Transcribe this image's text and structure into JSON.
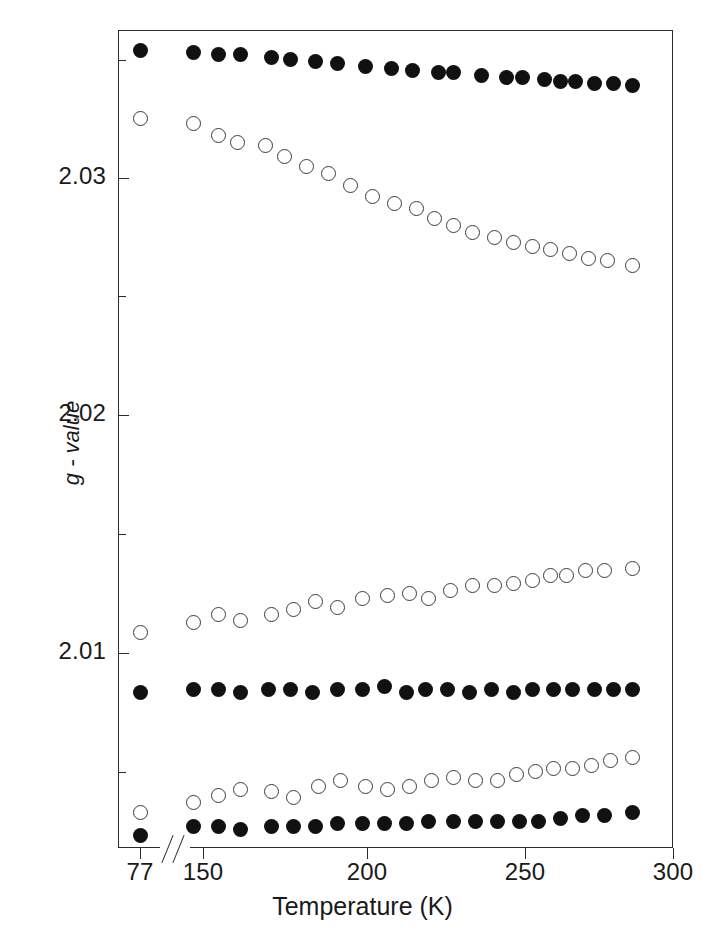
{
  "figure": {
    "width": 725,
    "height": 932,
    "background": "#ffffff",
    "marker_colors": {
      "filled": "#111111",
      "open_edge": "#3a3a3a",
      "open_face": "#ffffff"
    },
    "axis_color": "#2b2b2b"
  },
  "axis_titles": {
    "x": "Temperature (K)",
    "y": "g - value"
  },
  "x_axis": {
    "tick_labels": [
      "77",
      "150",
      "200",
      "250",
      "300"
    ],
    "tick_values": [
      77,
      150,
      200,
      250,
      300
    ],
    "tick_pixels": [
      140,
      203,
      367,
      525,
      673
    ],
    "broken_axis": true,
    "break_between": [
      77,
      150
    ],
    "break_symbol": "//"
  },
  "y_axis": {
    "tick_labels": [
      "2.03",
      "2.02",
      "2.01"
    ],
    "tick_values": [
      2.03,
      2.02,
      2.01
    ],
    "tick_pixels": [
      178,
      415,
      653
    ],
    "minor_tick_pixels": [
      60,
      296,
      534,
      772
    ],
    "minor_tick_values": [
      2.035,
      2.025,
      2.015,
      2.005
    ],
    "range": [
      2.0025,
      2.0375
    ]
  },
  "chart_data": {
    "type": "scatter",
    "title": "",
    "xlabel": "Temperature (K)",
    "ylabel": "g - value",
    "xlim": [
      70,
      300
    ],
    "ylim": [
      2.0025,
      2.0375
    ],
    "grid": false,
    "legend": "none",
    "broken_x_axis": {
      "from": 80,
      "to": 145
    },
    "series": [
      {
        "name": "upper-filled",
        "marker": "filled-circle",
        "x": [
          77,
          147,
          155,
          162,
          172,
          178,
          186,
          193,
          202,
          210,
          217,
          225,
          230,
          239,
          247,
          252,
          259,
          264,
          269,
          275,
          281,
          287
        ],
        "y": [
          2.0352,
          2.0351,
          2.035,
          2.035,
          2.0349,
          2.0348,
          2.0347,
          2.0346,
          2.0345,
          2.0344,
          2.0343,
          2.0342,
          2.0342,
          2.0341,
          2.034,
          2.034,
          2.0339,
          2.0338,
          2.0338,
          2.0337,
          2.0337,
          2.0336
        ],
        "y_pixels": [
          50,
          52,
          54,
          54,
          57,
          59,
          61,
          63,
          66,
          68,
          70,
          72,
          72,
          75,
          77,
          77,
          79,
          81,
          81,
          83,
          83,
          85
        ]
      },
      {
        "name": "upper-open",
        "marker": "open-circle",
        "x": [
          77,
          147,
          155,
          161,
          170,
          176,
          183,
          190,
          197,
          204,
          211,
          218,
          224,
          230,
          236,
          243,
          249,
          255,
          261,
          267,
          273,
          279,
          287
        ],
        "y": [
          2.0325,
          2.0323,
          2.0318,
          2.0315,
          2.0314,
          2.0309,
          2.0305,
          2.0302,
          2.0297,
          2.0292,
          2.0289,
          2.0287,
          2.0283,
          2.028,
          2.0277,
          2.0275,
          2.0273,
          2.0271,
          2.027,
          2.0268,
          2.0266,
          2.0265,
          2.0263
        ],
        "y_pixels": [
          118,
          123,
          135,
          142,
          145,
          156,
          166,
          173,
          185,
          196,
          203,
          208,
          218,
          225,
          232,
          237,
          242,
          246,
          249,
          253,
          258,
          260,
          265
        ]
      },
      {
        "name": "middle-open",
        "marker": "open-circle",
        "x": [
          77,
          147,
          155,
          162,
          172,
          179,
          186,
          193,
          201,
          209,
          216,
          222,
          229,
          236,
          243,
          249,
          255,
          261,
          266,
          272,
          278,
          287
        ],
        "y": [
          2.0108,
          2.0112,
          2.0115,
          2.0113,
          2.0115,
          2.0117,
          2.012,
          2.0118,
          2.0121,
          2.0122,
          2.0123,
          2.0121,
          2.0124,
          2.0126,
          2.0126,
          2.0127,
          2.0128,
          2.013,
          2.013,
          2.0132,
          2.0132,
          2.0133
        ],
        "y_pixels": [
          632,
          622,
          614,
          620,
          614,
          609,
          601,
          607,
          598,
          595,
          593,
          598,
          590,
          585,
          585,
          583,
          580,
          575,
          575,
          570,
          570,
          568
        ]
      },
      {
        "name": "middle-filled",
        "marker": "filled-circle",
        "x": [
          77,
          147,
          155,
          162,
          171,
          178,
          185,
          193,
          201,
          208,
          215,
          221,
          228,
          235,
          242,
          249,
          255,
          262,
          268,
          275,
          281,
          287
        ],
        "y": [
          2.0081,
          2.0082,
          2.0082,
          2.0081,
          2.0082,
          2.0082,
          2.0081,
          2.0082,
          2.0082,
          2.0083,
          2.0081,
          2.0082,
          2.0082,
          2.0081,
          2.0082,
          2.0081,
          2.0082,
          2.0082,
          2.0082,
          2.0082,
          2.0082,
          2.0082
        ],
        "y_pixels": [
          692,
          689,
          689,
          692,
          689,
          689,
          692,
          689,
          689,
          686,
          692,
          689,
          689,
          692,
          689,
          692,
          689,
          689,
          689,
          689,
          689,
          689
        ]
      },
      {
        "name": "lower-open",
        "marker": "open-circle",
        "x": [
          77,
          147,
          155,
          162,
          172,
          179,
          187,
          194,
          202,
          209,
          216,
          223,
          230,
          237,
          244,
          250,
          256,
          262,
          268,
          274,
          280,
          287
        ],
        "y": [
          2.0039,
          2.0043,
          2.0045,
          2.0047,
          2.0046,
          2.0044,
          2.0048,
          2.005,
          2.0048,
          2.0047,
          2.0048,
          2.005,
          2.0051,
          2.005,
          2.005,
          2.0052,
          2.0053,
          2.0054,
          2.0054,
          2.0055,
          2.0057,
          2.0058
        ],
        "y_pixels": [
          812,
          802,
          795,
          789,
          791,
          797,
          786,
          780,
          786,
          789,
          786,
          780,
          777,
          780,
          780,
          774,
          771,
          768,
          768,
          765,
          760,
          757
        ]
      },
      {
        "name": "lower-filled",
        "marker": "filled-circle",
        "x": [
          77,
          147,
          155,
          162,
          172,
          179,
          186,
          193,
          201,
          208,
          215,
          222,
          230,
          237,
          244,
          251,
          257,
          264,
          271,
          278,
          287
        ],
        "y": [
          2.003,
          2.0034,
          2.0034,
          2.0033,
          2.0034,
          2.0034,
          2.0034,
          2.0035,
          2.0035,
          2.0035,
          2.0035,
          2.0036,
          2.0036,
          2.0036,
          2.0036,
          2.0036,
          2.0036,
          2.0037,
          2.0038,
          2.0038,
          2.0039
        ],
        "y_pixels": [
          835,
          826,
          826,
          829,
          826,
          826,
          826,
          823,
          823,
          823,
          823,
          821,
          821,
          821,
          821,
          821,
          821,
          818,
          815,
          815,
          812
        ]
      }
    ]
  }
}
